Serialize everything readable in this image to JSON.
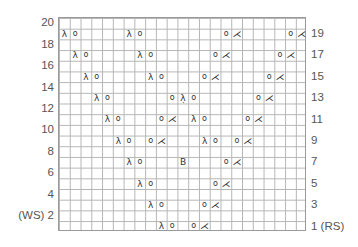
{
  "chart": {
    "columns": 23,
    "rows": 20,
    "symbols": {
      "ssk": "λ",
      "yo": "o",
      "k2tog": "⋌",
      "sk2p": "λ̣",
      "bobble": "B"
    },
    "row_labels_left": [
      {
        "row": 20,
        "text": "20"
      },
      {
        "row": 18,
        "text": "18"
      },
      {
        "row": 16,
        "text": "16"
      },
      {
        "row": 14,
        "text": "14"
      },
      {
        "row": 12,
        "text": "12"
      },
      {
        "row": 10,
        "text": "10"
      },
      {
        "row": 8,
        "text": "8"
      },
      {
        "row": 6,
        "text": "6"
      },
      {
        "row": 4,
        "text": "4"
      },
      {
        "row": 2,
        "text": "(WS) 2"
      }
    ],
    "row_labels_right": [
      {
        "row": 19,
        "text": "19"
      },
      {
        "row": 17,
        "text": "17"
      },
      {
        "row": 15,
        "text": "15"
      },
      {
        "row": 13,
        "text": "13"
      },
      {
        "row": 11,
        "text": "11"
      },
      {
        "row": 9,
        "text": "9"
      },
      {
        "row": 7,
        "text": "7"
      },
      {
        "row": 5,
        "text": "5"
      },
      {
        "row": 3,
        "text": "3"
      },
      {
        "row": 1,
        "text": "1 (RS)"
      }
    ],
    "stitches": [
      {
        "row": 19,
        "col": 1,
        "type": "ssk"
      },
      {
        "row": 19,
        "col": 2,
        "type": "yo"
      },
      {
        "row": 19,
        "col": 7,
        "type": "ssk"
      },
      {
        "row": 19,
        "col": 8,
        "type": "yo"
      },
      {
        "row": 19,
        "col": 16,
        "type": "yo"
      },
      {
        "row": 19,
        "col": 17,
        "type": "k2tog"
      },
      {
        "row": 19,
        "col": 22,
        "type": "yo"
      },
      {
        "row": 19,
        "col": 23,
        "type": "k2tog"
      },
      {
        "row": 17,
        "col": 2,
        "type": "ssk"
      },
      {
        "row": 17,
        "col": 3,
        "type": "yo"
      },
      {
        "row": 17,
        "col": 8,
        "type": "ssk"
      },
      {
        "row": 17,
        "col": 9,
        "type": "yo"
      },
      {
        "row": 17,
        "col": 15,
        "type": "yo"
      },
      {
        "row": 17,
        "col": 16,
        "type": "k2tog"
      },
      {
        "row": 17,
        "col": 21,
        "type": "yo"
      },
      {
        "row": 17,
        "col": 22,
        "type": "k2tog"
      },
      {
        "row": 15,
        "col": 3,
        "type": "ssk"
      },
      {
        "row": 15,
        "col": 4,
        "type": "yo"
      },
      {
        "row": 15,
        "col": 9,
        "type": "ssk"
      },
      {
        "row": 15,
        "col": 10,
        "type": "yo"
      },
      {
        "row": 15,
        "col": 14,
        "type": "yo"
      },
      {
        "row": 15,
        "col": 15,
        "type": "k2tog"
      },
      {
        "row": 15,
        "col": 20,
        "type": "yo"
      },
      {
        "row": 15,
        "col": 21,
        "type": "k2tog"
      },
      {
        "row": 13,
        "col": 4,
        "type": "ssk"
      },
      {
        "row": 13,
        "col": 5,
        "type": "yo"
      },
      {
        "row": 13,
        "col": 11,
        "type": "yo"
      },
      {
        "row": 13,
        "col": 12,
        "type": "sk2p"
      },
      {
        "row": 13,
        "col": 13,
        "type": "yo"
      },
      {
        "row": 13,
        "col": 19,
        "type": "yo"
      },
      {
        "row": 13,
        "col": 20,
        "type": "k2tog"
      },
      {
        "row": 11,
        "col": 5,
        "type": "ssk"
      },
      {
        "row": 11,
        "col": 6,
        "type": "yo"
      },
      {
        "row": 11,
        "col": 10,
        "type": "yo"
      },
      {
        "row": 11,
        "col": 11,
        "type": "k2tog"
      },
      {
        "row": 11,
        "col": 13,
        "type": "ssk"
      },
      {
        "row": 11,
        "col": 14,
        "type": "yo"
      },
      {
        "row": 11,
        "col": 18,
        "type": "yo"
      },
      {
        "row": 11,
        "col": 19,
        "type": "k2tog"
      },
      {
        "row": 9,
        "col": 6,
        "type": "ssk"
      },
      {
        "row": 9,
        "col": 7,
        "type": "yo"
      },
      {
        "row": 9,
        "col": 9,
        "type": "yo"
      },
      {
        "row": 9,
        "col": 10,
        "type": "k2tog"
      },
      {
        "row": 9,
        "col": 14,
        "type": "ssk"
      },
      {
        "row": 9,
        "col": 15,
        "type": "yo"
      },
      {
        "row": 9,
        "col": 17,
        "type": "yo"
      },
      {
        "row": 9,
        "col": 18,
        "type": "k2tog"
      },
      {
        "row": 7,
        "col": 7,
        "type": "ssk"
      },
      {
        "row": 7,
        "col": 8,
        "type": "yo"
      },
      {
        "row": 7,
        "col": 12,
        "type": "bobble"
      },
      {
        "row": 7,
        "col": 16,
        "type": "yo"
      },
      {
        "row": 7,
        "col": 17,
        "type": "k2tog"
      },
      {
        "row": 5,
        "col": 8,
        "type": "ssk"
      },
      {
        "row": 5,
        "col": 9,
        "type": "yo"
      },
      {
        "row": 5,
        "col": 15,
        "type": "yo"
      },
      {
        "row": 5,
        "col": 16,
        "type": "k2tog"
      },
      {
        "row": 3,
        "col": 9,
        "type": "ssk"
      },
      {
        "row": 3,
        "col": 10,
        "type": "yo"
      },
      {
        "row": 3,
        "col": 14,
        "type": "yo"
      },
      {
        "row": 3,
        "col": 15,
        "type": "k2tog"
      },
      {
        "row": 1,
        "col": 10,
        "type": "ssk"
      },
      {
        "row": 1,
        "col": 11,
        "type": "yo"
      },
      {
        "row": 1,
        "col": 13,
        "type": "yo"
      },
      {
        "row": 1,
        "col": 14,
        "type": "k2tog"
      }
    ]
  }
}
